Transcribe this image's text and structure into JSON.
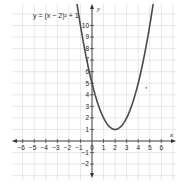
{
  "chart_data": {
    "type": "line",
    "title": "",
    "equation_label": "y = (x − 2)² + 1",
    "function": "y = (x - 2)^2 + 1",
    "xlabel": "x",
    "ylabel": "y",
    "xlim": [
      -7,
      7
    ],
    "ylim": [
      -3,
      11.5
    ],
    "grid": true,
    "x_ticks": [
      -6,
      -5,
      -4,
      -3,
      -2,
      -1,
      0,
      1,
      2,
      3,
      4,
      5,
      6
    ],
    "y_ticks": [
      -2,
      -1,
      1,
      2,
      3,
      4,
      5,
      6,
      7,
      8,
      9,
      10
    ],
    "series": [
      {
        "name": "y = (x − 2)² + 1",
        "x": [
          -1.4,
          -1,
          0,
          1,
          2,
          3,
          4,
          5,
          5.4
        ],
        "values": [
          12.56,
          10,
          5,
          2,
          1,
          2,
          5,
          10,
          12.56
        ]
      }
    ],
    "vertex": [
      2,
      1
    ],
    "points": [
      {
        "x": 4.7,
        "y": 4.6
      }
    ],
    "colors": {
      "curve": "#4a4a4a",
      "grid": "#d6d6d6",
      "axis": "#333333",
      "background": "#ffffff"
    }
  }
}
